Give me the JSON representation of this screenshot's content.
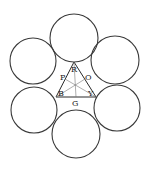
{
  "diagram": {
    "circles": [
      {
        "name": "circle-top",
        "cx": 74,
        "cy": 38,
        "r": 24
      },
      {
        "name": "circle-upper-left",
        "cx": 33,
        "cy": 61,
        "r": 23
      },
      {
        "name": "circle-upper-right",
        "cx": 115,
        "cy": 60,
        "r": 24
      },
      {
        "name": "circle-lower-left",
        "cx": 34,
        "cy": 110,
        "r": 23
      },
      {
        "name": "circle-lower-right",
        "cx": 117,
        "cy": 108,
        "r": 23
      },
      {
        "name": "circle-bottom",
        "cx": 76,
        "cy": 134,
        "r": 24
      }
    ],
    "triangle": {
      "vertices": {
        "R": [
          74,
          62
        ],
        "B": [
          56,
          97
        ],
        "Y": [
          96,
          97
        ]
      }
    },
    "labels": {
      "R": "R",
      "P": "P",
      "O": "O",
      "B": "B",
      "Y": "Y",
      "G": "G"
    },
    "colors": {
      "stroke": "#3a3a3a",
      "background": "#ffffff"
    }
  }
}
